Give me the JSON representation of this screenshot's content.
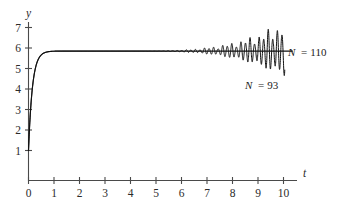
{
  "chart_data": {
    "type": "line",
    "title": "",
    "subtitle": "",
    "xlabel": "t",
    "ylabel": "y",
    "xlim": [
      0,
      10.35
    ],
    "ylim": [
      0,
      7.5
    ],
    "grid": false,
    "legend_position": "inline-right",
    "xticks": [
      "0",
      "1",
      "2",
      "3",
      "4",
      "5",
      "6",
      "7",
      "8",
      "9",
      "10"
    ],
    "xtick_values": [
      0,
      1,
      2,
      3,
      4,
      5,
      6,
      7,
      8,
      9,
      10
    ],
    "yticks": [
      "1",
      "2",
      "3",
      "4",
      "5",
      "6",
      "7"
    ],
    "ytick_values": [
      1,
      2,
      3,
      4,
      5,
      6,
      7
    ],
    "series": [
      {
        "name": "N = 110",
        "label": "N = 110",
        "color": "#111111",
        "style": "smooth",
        "description": "monotone rise from y=1 at t=0 to steady plateau y=5.85",
        "initial_value": 1.0,
        "plateau_value": 5.85,
        "rise_rate": 6.5,
        "x": [
          0,
          0.1,
          0.2,
          0.3,
          0.4,
          0.5,
          0.6,
          0.7,
          0.8,
          0.9,
          1.0,
          1.2,
          1.5,
          2.0,
          3.0,
          4.0,
          5.0,
          6.0,
          7.0,
          8.0,
          9.0,
          10.0
        ],
        "y": [
          1.0,
          2.24,
          3.23,
          4.02,
          4.63,
          5.1,
          5.43,
          5.63,
          5.74,
          5.8,
          5.83,
          5.85,
          5.85,
          5.85,
          5.85,
          5.85,
          5.85,
          5.85,
          5.85,
          5.85,
          5.85,
          5.85
        ]
      },
      {
        "name": "N = 93",
        "label": "N = 93",
        "color": "#111111",
        "style": "oscillating",
        "description": "same rise then growing high-frequency oscillation about y=5.85 beginning near t=4, amplitude grows to about 1.35 at t=10",
        "initial_value": 1.0,
        "mean_value": 5.85,
        "oscillation_onset_t": 4.0,
        "oscillation_frequency_per_unit_t": 5.6,
        "max_amplitude": 1.35,
        "final_peak": 7.2,
        "final_trough": 4.7
      }
    ],
    "annotations": [
      {
        "text": "N = 110",
        "x": 10.25,
        "y": 5.85,
        "align": "left"
      },
      {
        "text": "N = 93",
        "x": 8.5,
        "y": 4.45,
        "align": "left"
      }
    ]
  },
  "axis_labels": {
    "y": "y",
    "t": "t"
  },
  "annotations": {
    "upper": {
      "var": "N",
      "eq": "=",
      "value": "110",
      "full": "N = 110"
    },
    "lower": {
      "var": "N",
      "eq": "=",
      "value": "93",
      "full": "N = 93"
    }
  },
  "colors": {
    "curve": "#111111",
    "axis": "#4a4a4a",
    "text": "#2b2b2b",
    "background": "#ffffff"
  }
}
